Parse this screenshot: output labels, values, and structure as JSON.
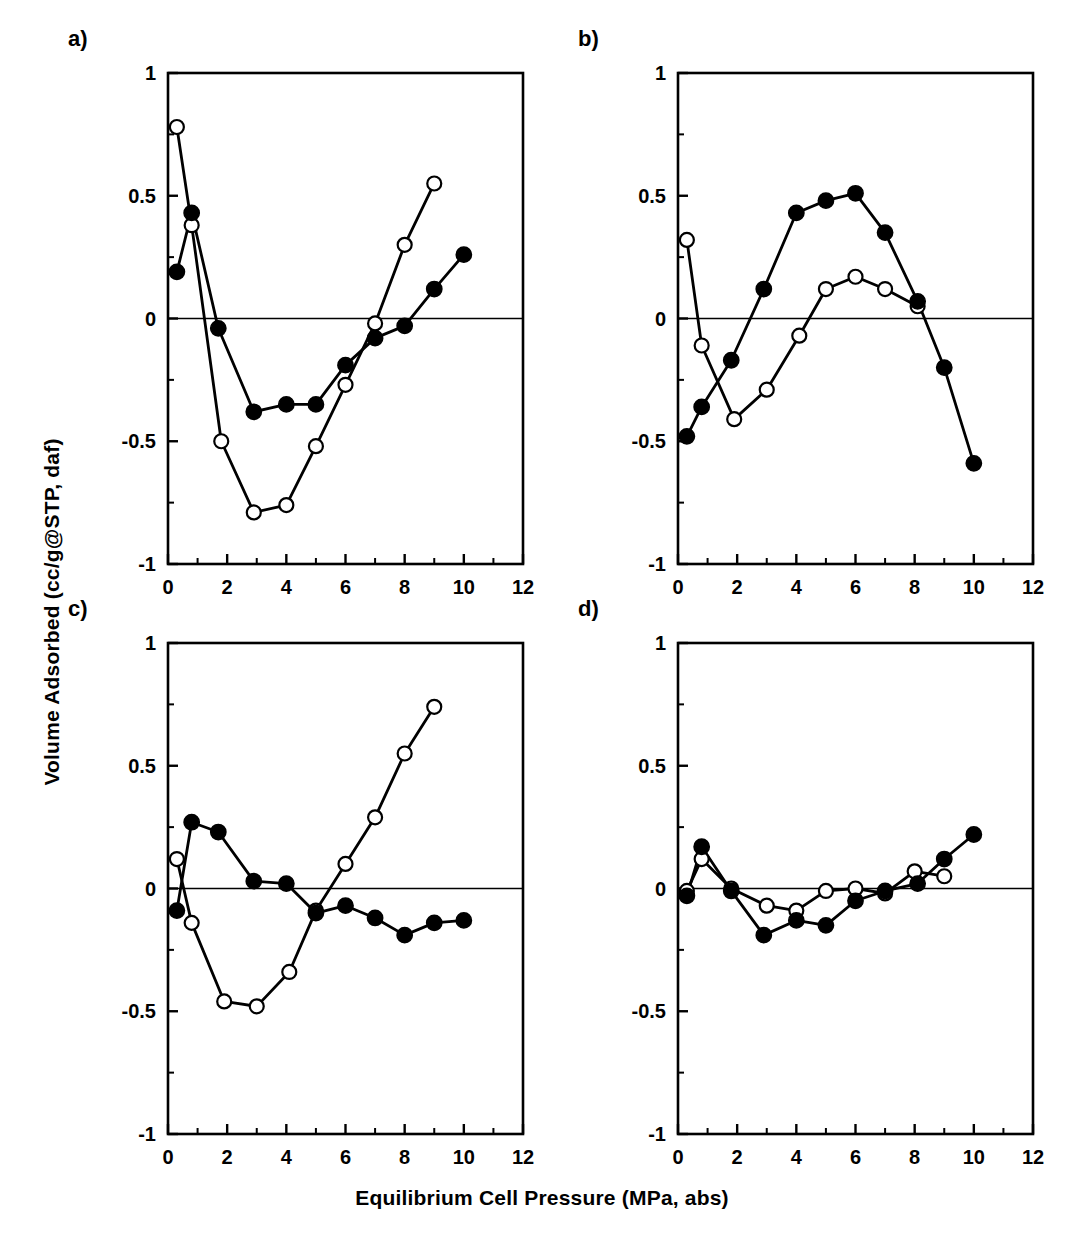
{
  "figure": {
    "x_axis_title": "Equilibrium Cell Pressure (MPa, abs)",
    "y_axis_title": "Volume Adsorbed (cc/g@STP, daf)",
    "panel_labels": [
      "a)",
      "b)",
      "c)",
      "d)"
    ]
  },
  "axes": {
    "x_ticks": [
      "0",
      "2",
      "4",
      "6",
      "8",
      "10",
      "12"
    ],
    "y_ticks": [
      "1",
      "0.5",
      "0",
      "-0.5",
      "-1"
    ],
    "x_tick_values": [
      0,
      2,
      4,
      6,
      8,
      10,
      12
    ],
    "y_tick_values": [
      1,
      0.5,
      0,
      -0.5,
      -1
    ],
    "x_minor_values": [
      1,
      3,
      5,
      7,
      9,
      11
    ],
    "y_minor_values": [
      0.75,
      0.25,
      -0.25,
      -0.75
    ],
    "xlim": [
      0,
      12
    ],
    "ylim": [
      -1,
      1
    ]
  },
  "style": {
    "line_color": "#000000",
    "marker_fill_closed": "#000000",
    "marker_fill_open": "#ffffff",
    "background": "#ffffff",
    "zero_line_color": "#000000"
  },
  "chart_data": [
    {
      "type": "line",
      "panel": "a)",
      "title": "",
      "xlabel": "Equilibrium Cell Pressure (MPa, abs)",
      "ylabel": "Volume Adsorbed (cc/g@STP, daf)",
      "xlim": [
        0,
        12
      ],
      "ylim": [
        -1,
        1
      ],
      "grid": false,
      "legend": "none",
      "series": [
        {
          "name": "open-circle-series",
          "marker": "open-circle",
          "x": [
            0.3,
            0.8,
            1.8,
            2.9,
            4.0,
            5.0,
            6.0,
            7.0,
            8.0,
            9.0
          ],
          "y": [
            0.78,
            0.38,
            -0.5,
            -0.79,
            -0.76,
            -0.52,
            -0.27,
            -0.02,
            0.3,
            0.55
          ]
        },
        {
          "name": "filled-circle-series",
          "marker": "filled-circle",
          "x": [
            0.3,
            0.8,
            1.7,
            2.9,
            4.0,
            5.0,
            6.0,
            7.0,
            8.0,
            9.0,
            10.0
          ],
          "y": [
            0.19,
            0.43,
            -0.04,
            -0.38,
            -0.35,
            -0.35,
            -0.19,
            -0.08,
            -0.03,
            0.12,
            0.26
          ]
        }
      ]
    },
    {
      "type": "line",
      "panel": "b)",
      "title": "",
      "xlabel": "Equilibrium Cell Pressure (MPa, abs)",
      "ylabel": "Volume Adsorbed (cc/g@STP, daf)",
      "xlim": [
        0,
        12
      ],
      "ylim": [
        -1,
        1
      ],
      "grid": false,
      "legend": "none",
      "series": [
        {
          "name": "open-circle-series",
          "marker": "open-circle",
          "x": [
            0.3,
            0.8,
            1.9,
            3.0,
            4.1,
            5.0,
            6.0,
            7.0,
            8.1
          ],
          "y": [
            0.32,
            -0.11,
            -0.41,
            -0.29,
            -0.07,
            0.12,
            0.17,
            0.12,
            0.05
          ]
        },
        {
          "name": "filled-circle-series",
          "marker": "filled-circle",
          "x": [
            0.3,
            0.8,
            1.8,
            2.9,
            4.0,
            5.0,
            6.0,
            7.0,
            8.1,
            9.0,
            10.0
          ],
          "y": [
            -0.48,
            -0.36,
            -0.17,
            0.12,
            0.43,
            0.48,
            0.51,
            0.35,
            0.07,
            -0.2,
            -0.59
          ]
        }
      ]
    },
    {
      "type": "line",
      "panel": "c)",
      "title": "",
      "xlabel": "Equilibrium Cell Pressure (MPa, abs)",
      "ylabel": "Volume Adsorbed (cc/g@STP, daf)",
      "xlim": [
        0,
        12
      ],
      "ylim": [
        -1,
        1
      ],
      "grid": false,
      "legend": "none",
      "series": [
        {
          "name": "open-circle-series",
          "marker": "open-circle",
          "x": [
            0.3,
            0.8,
            1.9,
            3.0,
            4.1,
            5.0,
            6.0,
            7.0,
            8.0,
            9.0
          ],
          "y": [
            0.12,
            -0.14,
            -0.46,
            -0.48,
            -0.34,
            -0.09,
            0.1,
            0.29,
            0.55,
            0.74
          ]
        },
        {
          "name": "filled-circle-series",
          "marker": "filled-circle",
          "x": [
            0.3,
            0.8,
            1.7,
            2.9,
            4.0,
            5.0,
            6.0,
            7.0,
            8.0,
            9.0,
            10.0
          ],
          "y": [
            -0.09,
            0.27,
            0.23,
            0.03,
            0.02,
            -0.1,
            -0.07,
            -0.12,
            -0.19,
            -0.14,
            -0.13
          ]
        }
      ]
    },
    {
      "type": "line",
      "panel": "d)",
      "title": "",
      "xlabel": "Equilibrium Cell Pressure (MPa, abs)",
      "ylabel": "Volume Adsorbed (cc/g@STP, daf)",
      "xlim": [
        0,
        12
      ],
      "ylim": [
        -1,
        1
      ],
      "grid": false,
      "legend": "none",
      "series": [
        {
          "name": "open-circle-series",
          "marker": "open-circle",
          "x": [
            0.3,
            0.8,
            1.8,
            3.0,
            4.0,
            5.0,
            6.0,
            7.0,
            8.0,
            9.0
          ],
          "y": [
            -0.01,
            0.12,
            0.0,
            -0.07,
            -0.09,
            -0.01,
            0.0,
            -0.02,
            0.07,
            0.05
          ]
        },
        {
          "name": "filled-circle-series",
          "marker": "filled-circle",
          "x": [
            0.3,
            0.8,
            1.8,
            2.9,
            4.0,
            5.0,
            6.0,
            7.0,
            8.1,
            9.0,
            10.0
          ],
          "y": [
            -0.03,
            0.17,
            -0.01,
            -0.19,
            -0.13,
            -0.15,
            -0.05,
            -0.01,
            0.02,
            0.12,
            0.22
          ]
        }
      ]
    }
  ]
}
